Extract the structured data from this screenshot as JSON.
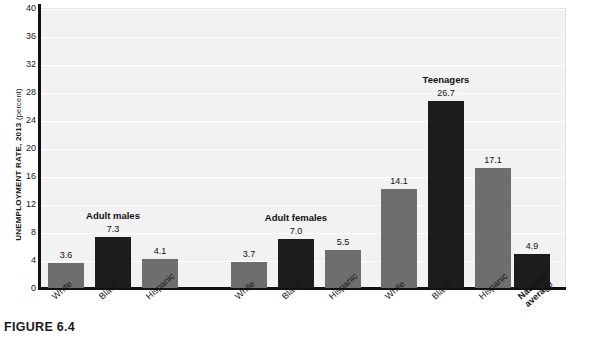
{
  "figure": {
    "caption": "FIGURE 6.4"
  },
  "chart_data": {
    "type": "bar",
    "title": "",
    "xlabel": "",
    "ylabel": "UNEMPLOYMENT RATE, 2013",
    "ylabel_unit": "(percent)",
    "ylim": [
      0,
      40
    ],
    "ytick_step": 4,
    "yticks": [
      0,
      4,
      8,
      12,
      16,
      20,
      24,
      28,
      32,
      36,
      40
    ],
    "grid": true,
    "legend": "none",
    "categories": [
      "White",
      "Black",
      "Hispanic"
    ],
    "groups": [
      {
        "name": "Adult males",
        "label": "Adult males",
        "bars": [
          {
            "category": "White",
            "value": 3.6,
            "label": "3.6",
            "color": "#6e6e6e"
          },
          {
            "category": "Black",
            "value": 7.3,
            "label": "7.3",
            "color": "#1c1c1c"
          },
          {
            "category": "Hispanic",
            "value": 4.1,
            "label": "4.1",
            "color": "#6e6e6e"
          }
        ]
      },
      {
        "name": "Adult females",
        "label": "Adult females",
        "bars": [
          {
            "category": "White",
            "value": 3.7,
            "label": "3.7",
            "color": "#6e6e6e"
          },
          {
            "category": "Black",
            "value": 7.0,
            "label": "7.0",
            "color": "#1c1c1c"
          },
          {
            "category": "Hispanic",
            "value": 5.5,
            "label": "5.5",
            "color": "#6e6e6e"
          }
        ]
      },
      {
        "name": "Teenagers",
        "label": "Teenagers",
        "bars": [
          {
            "category": "White",
            "value": 14.1,
            "label": "14.1",
            "color": "#6e6e6e"
          },
          {
            "category": "Black",
            "value": 26.7,
            "label": "26.7",
            "color": "#1c1c1c"
          },
          {
            "category": "Hispanic",
            "value": 17.1,
            "label": "17.1",
            "color": "#6e6e6e"
          }
        ]
      },
      {
        "name": "National average",
        "label": "",
        "bars": [
          {
            "category": "National average",
            "value": 4.9,
            "label": "4.9",
            "color": "#1c1c1c"
          }
        ]
      }
    ],
    "colors": {
      "gray_bar": "#6e6e6e",
      "dark_bar": "#1c1c1c",
      "plot_background": "#f2f2f2",
      "gridline": "#ffffff",
      "axis": "#111111"
    }
  }
}
